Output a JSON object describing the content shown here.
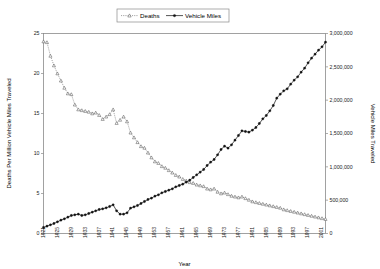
{
  "chart_data": {
    "type": "line",
    "title": "",
    "xlabel": "Year",
    "ylabel": "Deaths Per Million Vehicle Miles Traveled",
    "y2label": "Vehicle Miles Traveled",
    "grid": false,
    "legend_position": "top-center",
    "xlim": [
      1921,
      2002
    ],
    "ylim": [
      0,
      25
    ],
    "y2lim": [
      0,
      3000000
    ],
    "yticks": [
      0,
      5,
      10,
      15,
      20,
      25
    ],
    "ytick_labels": [
      "0",
      "5",
      "10",
      "15",
      "20",
      "25"
    ],
    "y2ticks": [
      0,
      500000,
      1000000,
      1500000,
      2000000,
      2500000,
      3000000
    ],
    "y2tick_labels": [
      "0",
      "500,000",
      "1,000,000",
      "1,500,000",
      "2,000,000",
      "2,500,000",
      "3,000,000"
    ],
    "xticks": [
      1921,
      1925,
      1929,
      1933,
      1937,
      1941,
      1945,
      1949,
      1953,
      1957,
      1961,
      1965,
      1969,
      1973,
      1977,
      1981,
      1985,
      1989,
      1993,
      1997,
      2001
    ],
    "xtick_labels": [
      "1921",
      "1925",
      "1929",
      "1933",
      "1937",
      "1941",
      "1945",
      "1949",
      "1953",
      "1957",
      "1961",
      "1965",
      "1969",
      "1973",
      "1977",
      "1981",
      "1985",
      "1989",
      "1993",
      "1997",
      "2001"
    ],
    "x": [
      1921,
      1922,
      1923,
      1924,
      1925,
      1926,
      1927,
      1928,
      1929,
      1930,
      1931,
      1932,
      1933,
      1934,
      1935,
      1936,
      1937,
      1938,
      1939,
      1940,
      1941,
      1942,
      1943,
      1944,
      1945,
      1946,
      1947,
      1948,
      1949,
      1950,
      1951,
      1952,
      1953,
      1954,
      1955,
      1956,
      1957,
      1958,
      1959,
      1960,
      1961,
      1962,
      1963,
      1964,
      1965,
      1966,
      1967,
      1968,
      1969,
      1970,
      1971,
      1972,
      1973,
      1974,
      1975,
      1976,
      1977,
      1978,
      1979,
      1980,
      1981,
      1982,
      1983,
      1984,
      1985,
      1986,
      1987,
      1988,
      1989,
      1990,
      1991,
      1992,
      1993,
      1994,
      1995,
      1996,
      1997,
      1998,
      1999,
      2000,
      2001,
      2002
    ],
    "series": [
      {
        "name": "Deaths",
        "axis": "left",
        "marker": "triangle",
        "linestyle": "dotted",
        "values": [
          24.0,
          23.9,
          22.2,
          21.0,
          20.0,
          19.1,
          18.2,
          17.5,
          17.4,
          16.1,
          15.5,
          15.4,
          15.3,
          15.2,
          15.0,
          15.1,
          14.8,
          14.3,
          14.6,
          14.9,
          15.5,
          13.8,
          14.2,
          14.6,
          14.0,
          12.6,
          12.0,
          11.4,
          10.9,
          10.7,
          10.1,
          9.5,
          9.0,
          8.8,
          8.4,
          8.2,
          7.9,
          7.6,
          7.3,
          7.1,
          6.8,
          6.6,
          6.4,
          6.3,
          6.1,
          6.0,
          5.9,
          5.6,
          5.5,
          5.6,
          5.2,
          5.0,
          5.1,
          4.9,
          4.7,
          4.6,
          4.5,
          4.6,
          4.4,
          4.2,
          4.0,
          3.9,
          3.8,
          3.7,
          3.6,
          3.5,
          3.4,
          3.3,
          3.2,
          3.0,
          2.9,
          2.8,
          2.7,
          2.6,
          2.5,
          2.4,
          2.3,
          2.2,
          2.1,
          2.0,
          1.9,
          1.8
        ]
      },
      {
        "name": "Vehicle Miles",
        "axis": "right",
        "marker": "diamond",
        "linestyle": "solid",
        "values": [
          90000,
          110000,
          130000,
          150000,
          175000,
          200000,
          220000,
          245000,
          270000,
          280000,
          290000,
          270000,
          280000,
          300000,
          320000,
          340000,
          360000,
          370000,
          385000,
          405000,
          430000,
          340000,
          290000,
          290000,
          310000,
          380000,
          400000,
          420000,
          450000,
          480000,
          510000,
          530000,
          560000,
          580000,
          610000,
          630000,
          650000,
          670000,
          700000,
          720000,
          740000,
          770000,
          800000,
          840000,
          880000,
          920000,
          960000,
          1020000,
          1070000,
          1110000,
          1180000,
          1260000,
          1310000,
          1280000,
          1330000,
          1400000,
          1470000,
          1540000,
          1530000,
          1520000,
          1550000,
          1590000,
          1650000,
          1720000,
          1770000,
          1840000,
          1920000,
          2030000,
          2090000,
          2140000,
          2170000,
          2240000,
          2300000,
          2350000,
          2420000,
          2480000,
          2560000,
          2630000,
          2690000,
          2750000,
          2800000,
          2870000
        ]
      }
    ]
  },
  "legend": {
    "entries": [
      {
        "label": "Deaths"
      },
      {
        "label": "Vehicle Miles"
      }
    ]
  },
  "axes": {
    "left_title": "Deaths Per Million Vehicle Miles Traveled",
    "right_title": "Vehicle Miles Traveled",
    "bottom_title": "Year"
  },
  "colors": {
    "deaths": "#555555",
    "miles": "#111111",
    "axis": "#8a8a8a",
    "background": "#ffffff"
  }
}
